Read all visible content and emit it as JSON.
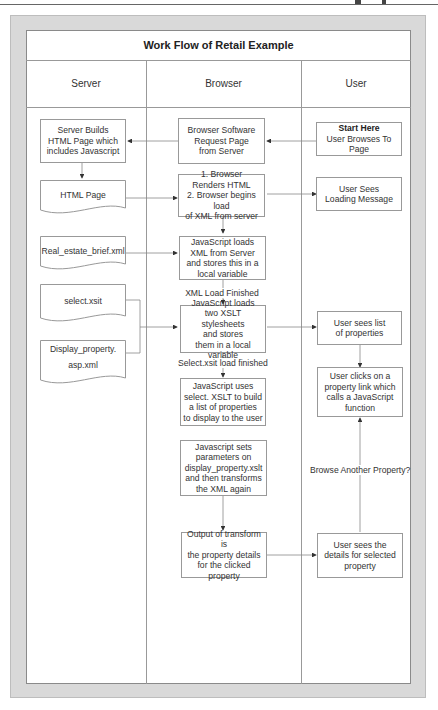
{
  "diagram": {
    "title": "Work Flow of Retail Example",
    "lanes": [
      {
        "id": "server",
        "label": "Server"
      },
      {
        "id": "browser",
        "label": "Browser"
      },
      {
        "id": "user",
        "label": "User"
      }
    ],
    "nodes": {
      "server_builds": {
        "lines": [
          "Server Builds",
          "HTML Page which",
          "includes Javascript"
        ]
      },
      "html_page": {
        "label": "HTML Page"
      },
      "real_estate": {
        "label": "Real_estate_brief.xml"
      },
      "select_xsit": {
        "label": "select.xsit"
      },
      "display_property": {
        "lines": [
          "Display_property.",
          "asp.xml"
        ]
      },
      "browser_request": {
        "lines": [
          "Browser Software",
          "Request Page",
          "from Server"
        ]
      },
      "browser_renders": {
        "lines": [
          "1. Browser",
          "Renders HTML",
          "2. Browser begins load",
          "of XML from server"
        ]
      },
      "js_loads_xml": {
        "lines": [
          "JavaScript loads",
          "XML from Server",
          "and stores this in a",
          "local variable"
        ]
      },
      "js_loads_xslt": {
        "lines": [
          "JavaScript loads",
          "two XSLT stylesheets",
          "and stores",
          "them in a local variable"
        ]
      },
      "js_uses_select": {
        "lines": [
          "JavaScript uses",
          "select. XSLT to build",
          "a list of properties",
          "to display to the user"
        ]
      },
      "js_sets_params": {
        "lines": [
          "Javascript sets",
          "parameters on",
          "display_property.xslt",
          "and then transforms",
          "the XML again"
        ]
      },
      "output_transform": {
        "lines": [
          "Output of transform is",
          "the property details",
          "for the clicked property"
        ]
      },
      "start_here": {
        "title": "Start Here",
        "lines": [
          "User Browses To Page"
        ]
      },
      "user_loading": {
        "lines": [
          "User Sees",
          "Loading Message"
        ]
      },
      "user_list": {
        "lines": [
          "User sees list",
          "of properties"
        ]
      },
      "user_clicks": {
        "lines": [
          "User clicks on a",
          "property link which",
          "calls a JavaScript",
          "function"
        ]
      },
      "user_details": {
        "lines": [
          "User sees the",
          "details for selected",
          "property"
        ]
      }
    },
    "edge_labels": {
      "xml_load_finished": "XML Load Finished",
      "select_load_finished": "Select.xsit load finished",
      "browse_another": "Browse Another Property?"
    },
    "colors": {
      "frame": "#d9d9d9",
      "line": "#999999",
      "arrow": "#333333"
    }
  }
}
